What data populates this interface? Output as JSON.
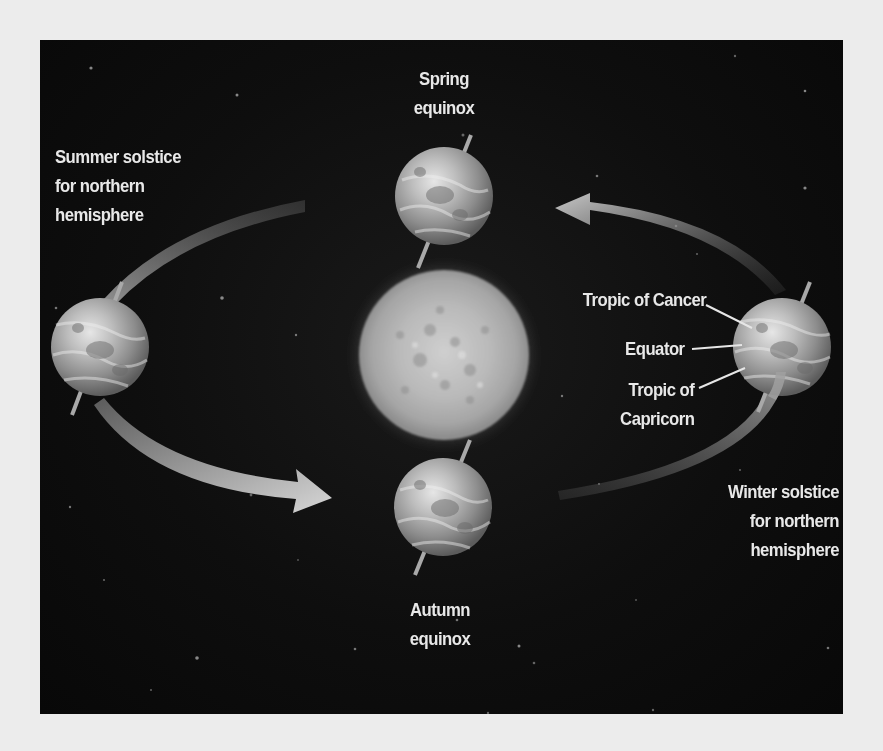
{
  "diagram": {
    "colors": {
      "background_page": "#ececec",
      "background_space": "#0c0c0c",
      "label_text": "#e8e8e8",
      "arrow": "#9a9a9a",
      "sun": "#bdbdbd"
    },
    "positions": {
      "spring": {
        "label_lines": [
          "Spring",
          "equinox"
        ]
      },
      "summer": {
        "label_lines": [
          "Summer solstice",
          "for northern",
          "hemisphere"
        ]
      },
      "winter": {
        "label_lines": [
          "Winter solstice",
          "for northern",
          "hemisphere"
        ]
      },
      "autumn": {
        "label_lines": [
          "Autumn",
          "equinox"
        ]
      }
    },
    "earth_features": {
      "tropic_of_cancer": "Tropic of Cancer",
      "equator": "Equator",
      "tropic_of_capricorn_lines": [
        "Tropic of",
        "Capricorn"
      ]
    },
    "icons": {
      "sun": "sun-icon",
      "earth": "earth-globe-icon",
      "orbit_arrow": "curved-arrow-icon"
    }
  }
}
